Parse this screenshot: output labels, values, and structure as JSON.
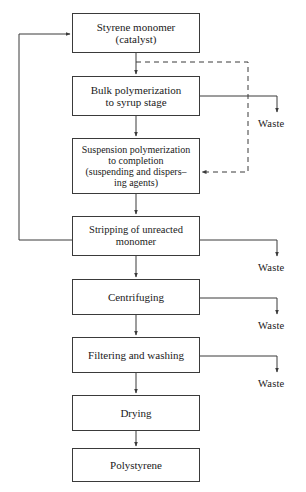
{
  "diagram": {
    "type": "process-flowchart",
    "canvas": {
      "width": 306,
      "height": 492
    },
    "colors": {
      "background": "#ffffff",
      "stroke": "#3a3a3a",
      "text": "#1a1a1a"
    },
    "nodes": [
      {
        "id": "styrene-monomer",
        "label": "Styrene  monomer\n(catalyst)",
        "x": 72,
        "y": 13,
        "w": 128,
        "h": 40,
        "font": "fs-11"
      },
      {
        "id": "bulk-polymerization",
        "label": "Bulk polymerization\nto syrup stage",
        "x": 72,
        "y": 76,
        "w": 128,
        "h": 40,
        "font": "fs-11"
      },
      {
        "id": "suspension-polymerization",
        "label": "Suspension polymerization\nto completion\n(suspending and dispers–\ning agents)",
        "x": 72,
        "y": 138,
        "w": 128,
        "h": 56,
        "font": "fs-10"
      },
      {
        "id": "stripping-of-unreacted-monomer",
        "label": "Stripping of  unreacted\nmonomer",
        "x": 72,
        "y": 216,
        "w": 128,
        "h": 40,
        "font": "fs-105"
      },
      {
        "id": "centrifuging",
        "label": "Centrifuging",
        "x": 72,
        "y": 279,
        "w": 128,
        "h": 36,
        "font": "fs-11"
      },
      {
        "id": "filtering-and-washing",
        "label": "Filtering and  washing",
        "x": 72,
        "y": 337,
        "w": 128,
        "h": 36,
        "font": "fs-11"
      },
      {
        "id": "drying",
        "label": "Drying",
        "x": 72,
        "y": 395,
        "w": 128,
        "h": 36,
        "font": "fs-11"
      },
      {
        "id": "polystyrene",
        "label": "Polystyrene",
        "x": 72,
        "y": 448,
        "w": 128,
        "h": 34,
        "font": "fs-11"
      }
    ],
    "waste_outlets": [
      {
        "id": "waste-bulk",
        "label": "Waste",
        "x": 258,
        "y": 118
      },
      {
        "id": "waste-stripping",
        "label": "Waste",
        "x": 258,
        "y": 262
      },
      {
        "id": "waste-centrifuging",
        "label": "Waste",
        "x": 258,
        "y": 320
      },
      {
        "id": "waste-filtering",
        "label": "Waste",
        "x": 258,
        "y": 378
      }
    ],
    "connections": [
      {
        "id": "styrene-to-bulk",
        "from": "styrene-monomer",
        "to": "bulk-polymerization",
        "style": "solid",
        "arrow": true
      },
      {
        "id": "bulk-to-suspension",
        "from": "bulk-polymerization",
        "to": "suspension-polymerization",
        "style": "solid",
        "arrow": true
      },
      {
        "id": "suspension-to-stripping",
        "from": "suspension-polymerization",
        "to": "stripping-of-unreacted-monomer",
        "style": "solid",
        "arrow": true
      },
      {
        "id": "stripping-to-centrifuging",
        "from": "stripping-of-unreacted-monomer",
        "to": "centrifuging",
        "style": "solid",
        "arrow": true
      },
      {
        "id": "centrifuging-to-filtering",
        "from": "centrifuging",
        "to": "filtering-and-washing",
        "style": "solid",
        "arrow": true
      },
      {
        "id": "filtering-to-drying",
        "from": "filtering-and-washing",
        "to": "drying",
        "style": "solid",
        "arrow": true
      },
      {
        "id": "drying-to-polystyrene",
        "from": "drying",
        "to": "polystyrene",
        "style": "solid",
        "arrow": true
      },
      {
        "id": "monomer-recycle-loop",
        "from": "stripping-of-unreacted-monomer",
        "to": "styrene-monomer",
        "style": "solid",
        "arrow": true,
        "routing": "left-recycle"
      },
      {
        "id": "bulk-bypass-dashed",
        "from": "styrene-monomer",
        "to": "suspension-polymerization",
        "style": "dashed",
        "arrow": true,
        "routing": "right-bypass"
      },
      {
        "id": "bulk-waste-line",
        "from": "bulk-polymerization",
        "to": "waste-bulk",
        "style": "solid",
        "arrow": true
      },
      {
        "id": "stripping-waste-line",
        "from": "stripping-of-unreacted-monomer",
        "to": "waste-stripping",
        "style": "solid",
        "arrow": true
      },
      {
        "id": "centrifuging-waste-line",
        "from": "centrifuging",
        "to": "waste-centrifuging",
        "style": "solid",
        "arrow": true
      },
      {
        "id": "filtering-waste-line",
        "from": "filtering-and-washing",
        "to": "waste-filtering",
        "style": "solid",
        "arrow": true
      }
    ]
  }
}
